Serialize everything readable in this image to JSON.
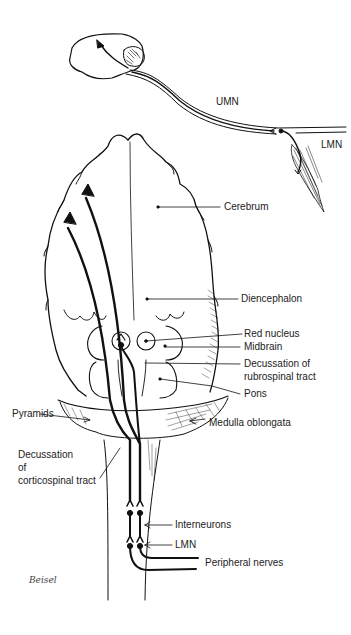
{
  "diagram": {
    "type": "anatomical motor pathway illustration",
    "colors": {
      "ink": "#111111",
      "background": "#ffffff",
      "label_text": "#222222"
    },
    "top_inset": {
      "labels": {
        "umn": "UMN",
        "lmn": "LMN"
      }
    },
    "main_labels": {
      "cerebrum": "Cerebrum",
      "diencephalon": "Diencephalon",
      "red_nucleus": "Red nucleus",
      "midbrain": "Midbrain",
      "decussation_rubro_1": "Decussation of",
      "decussation_rubro_2": "rubrospinal tract",
      "pons": "Pons",
      "pyramids": "Pyramids",
      "medulla": "Medulla oblongata",
      "decussation_cortico_1": "Decussation",
      "decussation_cortico_2": "of",
      "decussation_cortico_3": "corticospinal tract",
      "interneurons": "Interneurons",
      "lmn": "LMN",
      "peripheral_nerves": "Peripheral nerves"
    },
    "signature": "Beisel"
  }
}
